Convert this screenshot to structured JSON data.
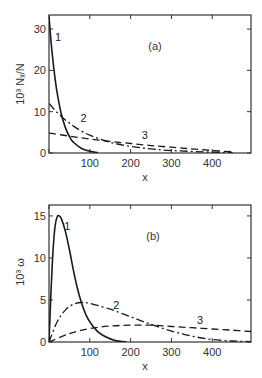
{
  "chart_data": [
    {
      "type": "line",
      "panel_label": "(a)",
      "title": "",
      "xlabel": "x",
      "ylabel": "10³ Nₓ/N",
      "xlim": [
        0,
        495
      ],
      "ylim": [
        0,
        33.4
      ],
      "x_ticks": [
        0,
        100,
        200,
        300,
        400
      ],
      "x_tick_labels": [
        "",
        "100",
        "200",
        "300",
        "400"
      ],
      "y_ticks": [
        0,
        10,
        20,
        30
      ],
      "y_tick_labels": [
        "0",
        "10",
        "20",
        "30"
      ],
      "grid": false,
      "legend": "inline curve labels",
      "series": [
        {
          "name": "1",
          "style": "solid",
          "x": [
            0,
            5,
            10,
            15,
            20,
            30,
            40,
            50,
            60,
            80,
            100,
            120
          ],
          "y": [
            33,
            27,
            22,
            18,
            14.5,
            9.5,
            6.2,
            4,
            2.6,
            1.1,
            0.4,
            0.1
          ]
        },
        {
          "name": "2",
          "style": "dash-dot",
          "x": [
            0,
            20,
            40,
            60,
            80,
            100,
            150,
            200,
            250,
            300,
            400,
            450
          ],
          "y": [
            12,
            9.8,
            8,
            6.5,
            5.3,
            4.3,
            2.6,
            1.6,
            1.0,
            0.6,
            0.2,
            0.1
          ]
        },
        {
          "name": "3",
          "style": "dashed",
          "x": [
            0,
            50,
            100,
            150,
            200,
            250,
            300,
            350,
            400,
            450
          ],
          "y": [
            4.8,
            4.1,
            3.4,
            2.8,
            2.3,
            1.8,
            1.4,
            1.0,
            0.6,
            0.3
          ]
        }
      ],
      "curve_label_positions": [
        {
          "name": "1",
          "x": 22,
          "y": 27
        },
        {
          "name": "2",
          "x": 85,
          "y": 7.5
        },
        {
          "name": "3",
          "x": 235,
          "y": 3.5
        }
      ]
    },
    {
      "type": "line",
      "panel_label": "(b)",
      "title": "",
      "xlabel": "x",
      "ylabel": "10³ ω",
      "xlim": [
        0,
        495
      ],
      "ylim": [
        0,
        16.3
      ],
      "x_ticks": [
        0,
        100,
        200,
        300,
        400
      ],
      "x_tick_labels": [
        "",
        "100",
        "200",
        "300",
        "400"
      ],
      "y_ticks": [
        0,
        5,
        10,
        15
      ],
      "y_tick_labels": [
        "0",
        "5",
        "10",
        "15"
      ],
      "grid": false,
      "legend": "inline curve labels",
      "series": [
        {
          "name": "1",
          "style": "solid",
          "x": [
            0,
            5,
            10,
            15,
            20,
            25,
            30,
            40,
            50,
            60,
            70,
            80,
            90,
            100,
            120,
            140,
            160,
            180,
            190
          ],
          "y": [
            0,
            6,
            11,
            13.8,
            14.9,
            15,
            14.7,
            13.2,
            11,
            8.5,
            6.3,
            4.6,
            3.3,
            2.4,
            1.2,
            0.6,
            0.2,
            0.05,
            0
          ]
        },
        {
          "name": "2",
          "style": "dash-dot",
          "x": [
            0,
            20,
            40,
            60,
            80,
            100,
            150,
            200,
            250,
            300,
            350,
            400,
            450,
            495
          ],
          "y": [
            0,
            2.4,
            3.8,
            4.5,
            4.7,
            4.6,
            3.9,
            3.0,
            2.1,
            1.3,
            0.7,
            0.3,
            0.12,
            0.05
          ]
        },
        {
          "name": "3",
          "style": "dashed",
          "x": [
            0,
            50,
            100,
            150,
            200,
            250,
            300,
            350,
            400,
            450,
            495
          ],
          "y": [
            0,
            1.0,
            1.6,
            1.9,
            2.0,
            2.0,
            1.85,
            1.7,
            1.55,
            1.4,
            1.25
          ]
        }
      ],
      "curve_label_positions": [
        {
          "name": "1",
          "x": 45,
          "y": 13.3
        },
        {
          "name": "2",
          "x": 165,
          "y": 3.9
        },
        {
          "name": "3",
          "x": 370,
          "y": 2.2
        }
      ]
    }
  ]
}
